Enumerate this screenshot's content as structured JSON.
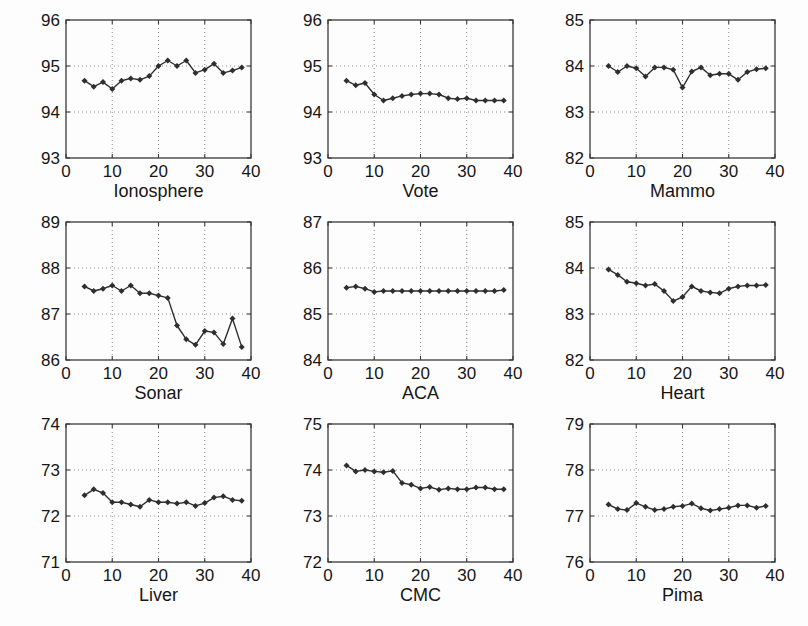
{
  "style": {
    "background": "#fdfdfd",
    "axis_color": "#3a3a3a",
    "grid_color": "#8f8f8f",
    "line_color": "#2e2e2e",
    "text_color": "#161616"
  },
  "chart_data": [
    {
      "type": "line",
      "title": "Ionosphere",
      "x": [
        4,
        6,
        8,
        10,
        12,
        14,
        16,
        18,
        20,
        22,
        24,
        26,
        28,
        30,
        32,
        34,
        36,
        38
      ],
      "values": [
        94.68,
        94.55,
        94.65,
        94.5,
        94.68,
        94.73,
        94.7,
        94.78,
        95.0,
        95.12,
        95.0,
        95.12,
        94.85,
        94.92,
        95.05,
        94.85,
        94.9,
        94.97
      ],
      "xlim": [
        0,
        40
      ],
      "ylim": [
        93,
        96
      ],
      "xticks": [
        0,
        10,
        20,
        30,
        40
      ],
      "yticks": [
        93,
        94,
        95,
        96
      ],
      "xlabel": "",
      "ylabel": "",
      "grid": true,
      "legend": null,
      "marker": "diamond",
      "title_position": "bottom"
    },
    {
      "type": "line",
      "title": "Vote",
      "x": [
        4,
        6,
        8,
        10,
        12,
        14,
        16,
        18,
        20,
        22,
        24,
        26,
        28,
        30,
        32,
        34,
        36,
        38
      ],
      "values": [
        94.68,
        94.58,
        94.63,
        94.38,
        94.25,
        94.3,
        94.35,
        94.38,
        94.4,
        94.4,
        94.38,
        94.3,
        94.28,
        94.3,
        94.25,
        94.25,
        94.25,
        94.25
      ],
      "xlim": [
        0,
        40
      ],
      "ylim": [
        93,
        96
      ],
      "xticks": [
        0,
        10,
        20,
        30,
        40
      ],
      "yticks": [
        93,
        94,
        95,
        96
      ],
      "xlabel": "",
      "ylabel": "",
      "grid": true,
      "legend": null,
      "marker": "diamond",
      "title_position": "bottom"
    },
    {
      "type": "line",
      "title": "Mammo",
      "x": [
        4,
        6,
        8,
        10,
        12,
        14,
        16,
        18,
        20,
        22,
        24,
        26,
        28,
        30,
        32,
        34,
        36,
        38
      ],
      "values": [
        84.0,
        83.87,
        84.0,
        83.95,
        83.77,
        83.97,
        83.97,
        83.92,
        83.53,
        83.88,
        83.97,
        83.8,
        83.83,
        83.83,
        83.7,
        83.87,
        83.93,
        83.95
      ],
      "xlim": [
        0,
        40
      ],
      "ylim": [
        82,
        85
      ],
      "xticks": [
        0,
        10,
        20,
        30,
        40
      ],
      "yticks": [
        82,
        83,
        84,
        85
      ],
      "xlabel": "",
      "ylabel": "",
      "grid": true,
      "legend": null,
      "marker": "diamond",
      "title_position": "bottom"
    },
    {
      "type": "line",
      "title": "Sonar",
      "x": [
        4,
        6,
        8,
        10,
        12,
        14,
        16,
        18,
        20,
        22,
        24,
        26,
        28,
        30,
        32,
        34,
        36,
        38
      ],
      "values": [
        87.6,
        87.5,
        87.55,
        87.62,
        87.5,
        87.62,
        87.45,
        87.45,
        87.4,
        87.35,
        86.75,
        86.45,
        86.33,
        86.63,
        86.6,
        86.35,
        86.9,
        86.28
      ],
      "xlim": [
        0,
        40
      ],
      "ylim": [
        86,
        89
      ],
      "xticks": [
        0,
        10,
        20,
        30,
        40
      ],
      "yticks": [
        86,
        87,
        88,
        89
      ],
      "xlabel": "",
      "ylabel": "",
      "grid": true,
      "legend": null,
      "marker": "diamond",
      "title_position": "bottom"
    },
    {
      "type": "line",
      "title": "ACA",
      "x": [
        4,
        6,
        8,
        10,
        12,
        14,
        16,
        18,
        20,
        22,
        24,
        26,
        28,
        30,
        32,
        34,
        36,
        38
      ],
      "values": [
        85.57,
        85.6,
        85.55,
        85.48,
        85.5,
        85.5,
        85.5,
        85.5,
        85.5,
        85.5,
        85.5,
        85.5,
        85.5,
        85.5,
        85.5,
        85.5,
        85.5,
        85.52
      ],
      "xlim": [
        0,
        40
      ],
      "ylim": [
        84,
        87
      ],
      "xticks": [
        0,
        10,
        20,
        30,
        40
      ],
      "yticks": [
        84,
        85,
        86,
        87
      ],
      "xlabel": "",
      "ylabel": "",
      "grid": true,
      "legend": null,
      "marker": "diamond",
      "title_position": "bottom"
    },
    {
      "type": "line",
      "title": "Heart",
      "x": [
        4,
        6,
        8,
        10,
        12,
        14,
        16,
        18,
        20,
        22,
        24,
        26,
        28,
        30,
        32,
        34,
        36,
        38
      ],
      "values": [
        83.97,
        83.85,
        83.7,
        83.67,
        83.62,
        83.65,
        83.5,
        83.28,
        83.37,
        83.6,
        83.5,
        83.47,
        83.45,
        83.55,
        83.6,
        83.62,
        83.62,
        83.63
      ],
      "xlim": [
        0,
        40
      ],
      "ylim": [
        82,
        85
      ],
      "xticks": [
        0,
        10,
        20,
        30,
        40
      ],
      "yticks": [
        82,
        83,
        84,
        85
      ],
      "xlabel": "",
      "ylabel": "",
      "grid": true,
      "legend": null,
      "marker": "diamond",
      "title_position": "bottom"
    },
    {
      "type": "line",
      "title": "Liver",
      "x": [
        4,
        6,
        8,
        10,
        12,
        14,
        16,
        18,
        20,
        22,
        24,
        26,
        28,
        30,
        32,
        34,
        36,
        38
      ],
      "values": [
        72.45,
        72.58,
        72.5,
        72.3,
        72.3,
        72.25,
        72.2,
        72.35,
        72.3,
        72.3,
        72.27,
        72.3,
        72.22,
        72.28,
        72.4,
        72.43,
        72.35,
        72.33
      ],
      "xlim": [
        0,
        40
      ],
      "ylim": [
        71,
        74
      ],
      "xticks": [
        0,
        10,
        20,
        30,
        40
      ],
      "yticks": [
        71,
        72,
        73,
        74
      ],
      "xlabel": "",
      "ylabel": "",
      "grid": true,
      "legend": null,
      "marker": "diamond",
      "title_position": "bottom"
    },
    {
      "type": "line",
      "title": "CMC",
      "x": [
        4,
        6,
        8,
        10,
        12,
        14,
        16,
        18,
        20,
        22,
        24,
        26,
        28,
        30,
        32,
        34,
        36,
        38
      ],
      "values": [
        74.1,
        73.97,
        74.0,
        73.97,
        73.95,
        73.98,
        73.72,
        73.68,
        73.6,
        73.63,
        73.57,
        73.6,
        73.58,
        73.58,
        73.62,
        73.62,
        73.58,
        73.58
      ],
      "xlim": [
        0,
        40
      ],
      "ylim": [
        72,
        75
      ],
      "xticks": [
        0,
        10,
        20,
        30,
        40
      ],
      "yticks": [
        72,
        73,
        74,
        75
      ],
      "xlabel": "",
      "ylabel": "",
      "grid": true,
      "legend": null,
      "marker": "diamond",
      "title_position": "bottom"
    },
    {
      "type": "line",
      "title": "Pima",
      "x": [
        4,
        6,
        8,
        10,
        12,
        14,
        16,
        18,
        20,
        22,
        24,
        26,
        28,
        30,
        32,
        34,
        36,
        38
      ],
      "values": [
        77.25,
        77.15,
        77.13,
        77.28,
        77.2,
        77.13,
        77.15,
        77.2,
        77.22,
        77.27,
        77.17,
        77.12,
        77.15,
        77.18,
        77.23,
        77.23,
        77.18,
        77.22
      ],
      "xlim": [
        0,
        40
      ],
      "ylim": [
        76,
        79
      ],
      "xticks": [
        0,
        10,
        20,
        30,
        40
      ],
      "yticks": [
        76,
        77,
        78,
        79
      ],
      "xlabel": "",
      "ylabel": "",
      "grid": true,
      "legend": null,
      "marker": "diamond",
      "title_position": "bottom"
    }
  ]
}
